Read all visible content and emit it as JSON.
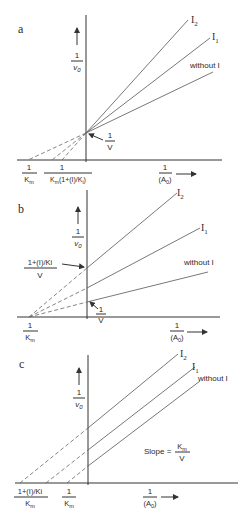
{
  "panels": [
    {
      "id": "a",
      "label": "a",
      "y_axis_label": {
        "num": "1",
        "den": "v0"
      },
      "x_axis_label": {
        "num": "1",
        "den": "(A0)"
      },
      "annotations": {
        "intercept": {
          "num": "1",
          "den": "V"
        }
      },
      "x_ticks": [
        {
          "num": "1",
          "den": "Km"
        },
        {
          "num": "1",
          "den": "Km(1+(I)/Ki)"
        }
      ],
      "lines": [
        {
          "name": "I2",
          "label": "I",
          "sub": "2"
        },
        {
          "name": "I1",
          "label": "I",
          "sub": "1"
        },
        {
          "name": "without I",
          "label": "without  I"
        }
      ]
    },
    {
      "id": "b",
      "label": "b",
      "y_axis_label": {
        "num": "1",
        "den": "v0"
      },
      "x_axis_label": {
        "num": "1",
        "den": "(A0)"
      },
      "annotations": {
        "intercept_inhibited": {
          "num": "1+(I)/Ki",
          "den": "V"
        },
        "intercept": {
          "num": "1",
          "den": "V"
        }
      },
      "x_ticks": [
        {
          "num": "1",
          "den": "Km"
        }
      ],
      "lines": [
        {
          "name": "I2",
          "label": "I",
          "sub": "2"
        },
        {
          "name": "I1",
          "label": "I",
          "sub": "1"
        },
        {
          "name": "without I",
          "label": "without  I"
        }
      ]
    },
    {
      "id": "c",
      "label": "c",
      "y_axis_label": {
        "num": "1",
        "den": "v0"
      },
      "x_axis_label": {
        "num": "1",
        "den": "(A0)"
      },
      "annotations": {
        "slope_prefix": "Slope =",
        "slope": {
          "num": "Km",
          "den": "V"
        }
      },
      "x_ticks": [
        {
          "num": "1+(I)/Ki",
          "den": "Km"
        },
        {
          "num": "1",
          "den": "Km"
        }
      ],
      "lines": [
        {
          "name": "I2",
          "label": "I",
          "sub": "2"
        },
        {
          "name": "I1",
          "label": "I",
          "sub": "1"
        },
        {
          "name": "without I",
          "label": "without  I"
        }
      ]
    }
  ]
}
